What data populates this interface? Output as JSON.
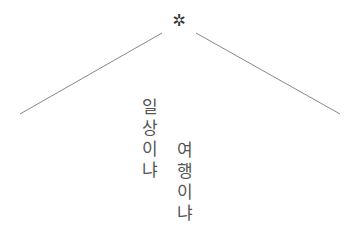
{
  "ornament": {
    "symbol": "✲",
    "icon": "asterisk-icon"
  },
  "roof": {
    "color": "#888888",
    "left_line": {
      "x1": 20,
      "y1": 114,
      "x2": 162,
      "y2": 33
    },
    "right_line": {
      "x1": 196,
      "y1": 33,
      "x2": 340,
      "y2": 114
    }
  },
  "poem": {
    "column_1": {
      "text": "일상이냐",
      "chars": [
        "일",
        "상",
        "이",
        "냐"
      ]
    },
    "column_2": {
      "text": "여행이냐",
      "chars": [
        "여",
        "행",
        "이",
        "냐"
      ]
    }
  }
}
